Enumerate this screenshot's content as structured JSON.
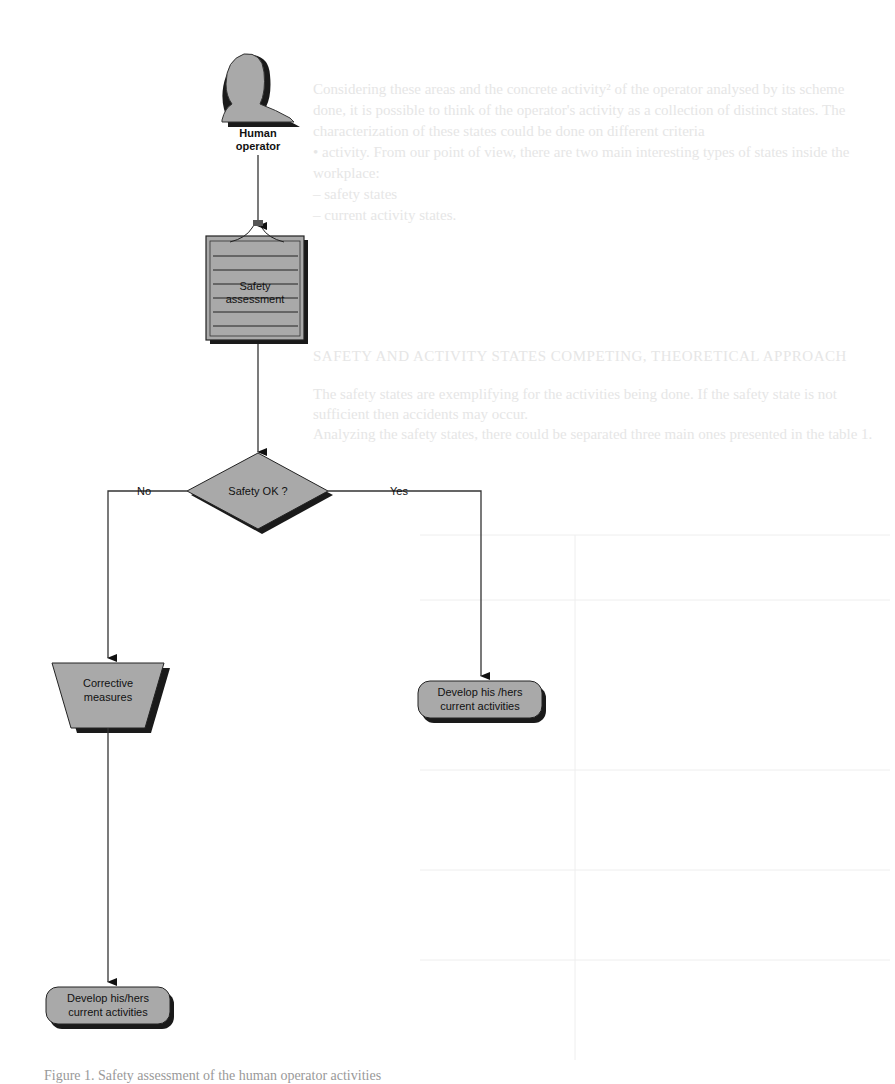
{
  "bleed_through": {
    "lines": [
      "Considering these areas and the concrete activity² of the operator analysed by its scheme",
      "done, it is possible to think of the operator's activity as a collection of distinct states. The",
      "characterization of these states could be done on different criteria",
      "• activity. From our point of view, there are two main interesting types of states inside the",
      "workplace:",
      "– safety states",
      "– current activity states."
    ],
    "heading": "SAFETY AND ACTIVITY STATES COMPETING, THEORETICAL APPROACH",
    "para2": [
      "The safety states are exemplifying for the activities being done. If the safety state is not",
      "sufficient then accidents may occur.",
      "Analyzing the safety states, there could be separated three main ones presented in the table 1."
    ]
  },
  "diagram": {
    "nodes": {
      "operator": {
        "label_line1": "Human",
        "label_line2": "operator"
      },
      "assessment": {
        "label_line1": "Safety",
        "label_line2": "assessment"
      },
      "decision": {
        "label": "Safety OK ?"
      },
      "corrective": {
        "label_line1": "Corrective",
        "label_line2": "measures"
      },
      "develop_yes": {
        "label_line1": "Develop his /hers",
        "label_line2": "current activities"
      },
      "develop_no": {
        "label_line1": "Develop his/hers",
        "label_line2": "current activities"
      }
    },
    "edges": {
      "no_label": "No",
      "yes_label": "Yes"
    },
    "colors": {
      "fill": "#a9a9a9",
      "shadow": "#1a1a1a",
      "stroke": "#222222",
      "line": "#333333"
    }
  },
  "caption": "Figure 1. Safety assessment of the human operator activities"
}
